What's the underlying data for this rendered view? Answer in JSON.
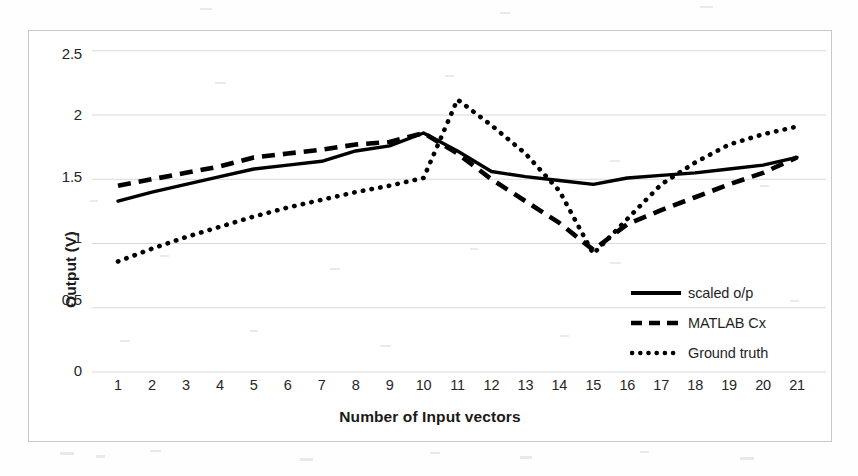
{
  "chart_data": {
    "type": "line",
    "title": "",
    "xlabel": "Number of Input vectors",
    "ylabel": "Output (V)",
    "xlim": [
      1,
      21
    ],
    "ylim": [
      0,
      2.5
    ],
    "grid": true,
    "legend_position": "inside-bottom-right",
    "x": [
      1,
      2,
      3,
      4,
      5,
      6,
      7,
      8,
      9,
      10,
      11,
      12,
      13,
      14,
      15,
      16,
      17,
      18,
      19,
      20,
      21
    ],
    "xtick_labels": [
      "1",
      "2",
      "3",
      "4",
      "5",
      "6",
      "7",
      "8",
      "9",
      "10",
      "11",
      "12",
      "13",
      "14",
      "15",
      "16",
      "17",
      "18",
      "19",
      "20",
      "21"
    ],
    "ytick_labels": [
      "0",
      "0.5",
      "1",
      "1.5",
      "2",
      "2.5"
    ],
    "ytick_values": [
      0,
      0.5,
      1,
      1.5,
      2,
      2.5
    ],
    "series": [
      {
        "name": "scaled o/p",
        "style": "solid",
        "color": "#000000",
        "values": [
          1.33,
          1.4,
          1.46,
          1.52,
          1.58,
          1.61,
          1.64,
          1.72,
          1.76,
          1.86,
          1.72,
          1.56,
          1.52,
          1.49,
          1.46,
          1.51,
          1.53,
          1.55,
          1.58,
          1.61,
          1.67
        ]
      },
      {
        "name": "MATLAB Cx",
        "style": "dashed",
        "color": "#000000",
        "values": [
          1.45,
          1.5,
          1.55,
          1.6,
          1.67,
          1.7,
          1.73,
          1.77,
          1.79,
          1.86,
          1.7,
          1.5,
          1.33,
          1.16,
          0.95,
          1.15,
          1.26,
          1.36,
          1.46,
          1.55,
          1.67
        ]
      },
      {
        "name": "Ground truth",
        "style": "dotted",
        "color": "#000000",
        "values": [
          0.86,
          0.96,
          1.05,
          1.13,
          1.21,
          1.28,
          1.34,
          1.4,
          1.45,
          1.51,
          2.12,
          1.92,
          1.7,
          1.41,
          0.92,
          1.19,
          1.46,
          1.63,
          1.77,
          1.85,
          1.91
        ]
      }
    ]
  },
  "legend": {
    "items": [
      {
        "label": "scaled o/p",
        "style": "solid"
      },
      {
        "label": "MATLAB Cx",
        "style": "dashed"
      },
      {
        "label": "Ground truth",
        "style": "dotted"
      }
    ]
  },
  "axes": {
    "y_title": "Output (V)",
    "x_title": "Number of Input vectors"
  },
  "colors": {
    "line": "#000000",
    "grid": "#d9d9d9",
    "frame": "#c9c9c9",
    "text": "#262626",
    "background": "#ffffff"
  }
}
